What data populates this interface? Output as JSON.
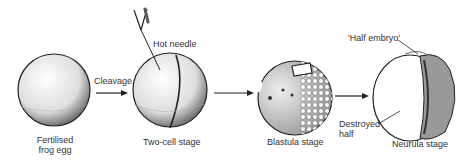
{
  "diagram": {
    "stages": [
      {
        "id": "egg",
        "label_line1": "Fertilised",
        "label_line2": "frog egg"
      },
      {
        "id": "two-cell",
        "label": "Two-cell stage"
      },
      {
        "id": "blastula",
        "label": "Blastula stage"
      },
      {
        "id": "neurula",
        "label": "Neurula stage"
      }
    ],
    "arrows": [
      {
        "from": "egg",
        "to": "two-cell",
        "label": "Cleavage"
      },
      {
        "from": "two-cell",
        "to": "blastula",
        "label": ""
      },
      {
        "from": "blastula",
        "to": "neurula",
        "label": ""
      }
    ],
    "annotations": {
      "hot_needle": "Hot needle",
      "half_embryo": "'Half embryo'",
      "destroyed_line1": "Destroyed",
      "destroyed_line2": "half"
    }
  }
}
